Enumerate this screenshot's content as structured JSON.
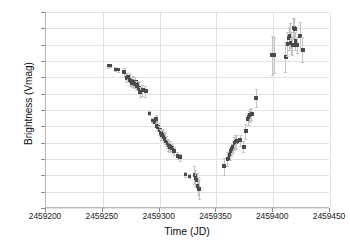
{
  "chart_data": {
    "type": "scatter",
    "title": "",
    "xlabel": "Time (JD)",
    "ylabel": "Brightness (Vmag)",
    "xlim": [
      2459200,
      2459450
    ],
    "ylim": [
      0.46,
      0.94
    ],
    "y_inverted": true,
    "grid": true,
    "legend": null,
    "xticks": [
      2459200,
      2459250,
      2459300,
      2459350,
      2459400,
      2459450
    ],
    "xtick_labels": [
      "2459200",
      "2459250",
      "2459300",
      "2459350",
      "2459400",
      "2459450"
    ],
    "yticks": [
      0.46,
      0.5,
      0.54,
      0.58,
      0.62,
      0.66,
      0.7,
      0.74,
      0.78,
      0.82,
      0.86,
      0.9,
      0.94
    ],
    "ytick_labels": [
      "0.46",
      "0.50",
      "0.54",
      "0.58",
      "0.62",
      "0.66",
      "0.70",
      "0.74",
      "0.78",
      "0.82",
      "0.86",
      "0.90",
      "0.94"
    ],
    "marker_color": "#4a4a4a",
    "errorbar_color": "#c4c4c4",
    "gridline_color": "#e2e2e2",
    "axis_color": "#b8b8b8",
    "series": [
      {
        "name": "V magnitude",
        "points": [
          {
            "x": 2459255,
            "y": 0.592,
            "yerr": 0.004
          },
          {
            "x": 2459257,
            "y": 0.591,
            "yerr": 0.004
          },
          {
            "x": 2459261,
            "y": 0.6,
            "yerr": 0.005
          },
          {
            "x": 2459264,
            "y": 0.602,
            "yerr": 0.005
          },
          {
            "x": 2459269,
            "y": 0.608,
            "yerr": 0.012
          },
          {
            "x": 2459271,
            "y": 0.622,
            "yerr": 0.01
          },
          {
            "x": 2459272,
            "y": 0.618,
            "yerr": 0.009
          },
          {
            "x": 2459274,
            "y": 0.626,
            "yerr": 0.013
          },
          {
            "x": 2459275,
            "y": 0.63,
            "yerr": 0.011
          },
          {
            "x": 2459276,
            "y": 0.634,
            "yerr": 0.01
          },
          {
            "x": 2459277,
            "y": 0.629,
            "yerr": 0.012
          },
          {
            "x": 2459278,
            "y": 0.636,
            "yerr": 0.011
          },
          {
            "x": 2459279,
            "y": 0.631,
            "yerr": 0.013
          },
          {
            "x": 2459280,
            "y": 0.64,
            "yerr": 0.012
          },
          {
            "x": 2459281,
            "y": 0.638,
            "yerr": 0.01
          },
          {
            "x": 2459282,
            "y": 0.646,
            "yerr": 0.014
          },
          {
            "x": 2459283,
            "y": 0.655,
            "yerr": 0.012
          },
          {
            "x": 2459285,
            "y": 0.652,
            "yerr": 0.013
          },
          {
            "x": 2459288,
            "y": 0.654,
            "yerr": 0.014
          },
          {
            "x": 2459291,
            "y": 0.708,
            "yerr": 0.005
          },
          {
            "x": 2459294,
            "y": 0.726,
            "yerr": 0.006
          },
          {
            "x": 2459296,
            "y": 0.73,
            "yerr": 0.012
          },
          {
            "x": 2459297,
            "y": 0.722,
            "yerr": 0.01
          },
          {
            "x": 2459298,
            "y": 0.738,
            "yerr": 0.011
          },
          {
            "x": 2459299,
            "y": 0.742,
            "yerr": 0.009
          },
          {
            "x": 2459300,
            "y": 0.75,
            "yerr": 0.012
          },
          {
            "x": 2459301,
            "y": 0.756,
            "yerr": 0.01
          },
          {
            "x": 2459302,
            "y": 0.76,
            "yerr": 0.013
          },
          {
            "x": 2459303,
            "y": 0.758,
            "yerr": 0.011
          },
          {
            "x": 2459304,
            "y": 0.766,
            "yerr": 0.012
          },
          {
            "x": 2459305,
            "y": 0.77,
            "yerr": 0.014
          },
          {
            "x": 2459306,
            "y": 0.776,
            "yerr": 0.013
          },
          {
            "x": 2459307,
            "y": 0.782,
            "yerr": 0.012
          },
          {
            "x": 2459308,
            "y": 0.786,
            "yerr": 0.014
          },
          {
            "x": 2459309,
            "y": 0.79,
            "yerr": 0.013
          },
          {
            "x": 2459310,
            "y": 0.788,
            "yerr": 0.012
          },
          {
            "x": 2459311,
            "y": 0.794,
            "yerr": 0.011
          },
          {
            "x": 2459313,
            "y": 0.8,
            "yerr": 0.01
          },
          {
            "x": 2459316,
            "y": 0.812,
            "yerr": 0.008
          },
          {
            "x": 2459318,
            "y": 0.816,
            "yerr": 0.008
          },
          {
            "x": 2459323,
            "y": 0.858,
            "yerr": 0.005
          },
          {
            "x": 2459326,
            "y": 0.862,
            "yerr": 0.005
          },
          {
            "x": 2459331,
            "y": 0.86,
            "yerr": 0.022
          },
          {
            "x": 2459332,
            "y": 0.866,
            "yerr": 0.02
          },
          {
            "x": 2459333,
            "y": 0.872,
            "yerr": 0.018
          },
          {
            "x": 2459334,
            "y": 0.886,
            "yerr": 0.022
          },
          {
            "x": 2459335,
            "y": 0.894,
            "yerr": 0.024
          },
          {
            "x": 2459357,
            "y": 0.838,
            "yerr": 0.02
          },
          {
            "x": 2459360,
            "y": 0.82,
            "yerr": 0.016
          },
          {
            "x": 2459362,
            "y": 0.81,
            "yerr": 0.012
          },
          {
            "x": 2459363,
            "y": 0.8,
            "yerr": 0.013
          },
          {
            "x": 2459364,
            "y": 0.796,
            "yerr": 0.012
          },
          {
            "x": 2459365,
            "y": 0.79,
            "yerr": 0.014
          },
          {
            "x": 2459366,
            "y": 0.782,
            "yerr": 0.016
          },
          {
            "x": 2459367,
            "y": 0.778,
            "yerr": 0.018
          },
          {
            "x": 2459368,
            "y": 0.776,
            "yerr": 0.016
          },
          {
            "x": 2459371,
            "y": 0.774,
            "yerr": 0.014
          },
          {
            "x": 2459374,
            "y": 0.79,
            "yerr": 0.014
          },
          {
            "x": 2459376,
            "y": 0.752,
            "yerr": 0.018
          },
          {
            "x": 2459378,
            "y": 0.722,
            "yerr": 0.014
          },
          {
            "x": 2459379,
            "y": 0.716,
            "yerr": 0.013
          },
          {
            "x": 2459380,
            "y": 0.712,
            "yerr": 0.015
          },
          {
            "x": 2459381,
            "y": 0.71,
            "yerr": 0.014
          },
          {
            "x": 2459385,
            "y": 0.67,
            "yerr": 0.022
          },
          {
            "x": 2459399,
            "y": 0.566,
            "yerr": 0.048
          },
          {
            "x": 2459401,
            "y": 0.566,
            "yerr": 0.044
          },
          {
            "x": 2459411,
            "y": 0.57,
            "yerr": 0.036
          },
          {
            "x": 2459413,
            "y": 0.538,
            "yerr": 0.03
          },
          {
            "x": 2459414,
            "y": 0.524,
            "yerr": 0.028
          },
          {
            "x": 2459415,
            "y": 0.518,
            "yerr": 0.03
          },
          {
            "x": 2459416,
            "y": 0.536,
            "yerr": 0.026
          },
          {
            "x": 2459417,
            "y": 0.542,
            "yerr": 0.024
          },
          {
            "x": 2459418,
            "y": 0.5,
            "yerr": 0.026
          },
          {
            "x": 2459419,
            "y": 0.502,
            "yerr": 0.024
          },
          {
            "x": 2459420,
            "y": 0.53,
            "yerr": 0.022
          },
          {
            "x": 2459421,
            "y": 0.54,
            "yerr": 0.02
          },
          {
            "x": 2459424,
            "y": 0.518,
            "yerr": 0.034
          },
          {
            "x": 2459426,
            "y": 0.552,
            "yerr": 0.03
          }
        ]
      }
    ]
  }
}
